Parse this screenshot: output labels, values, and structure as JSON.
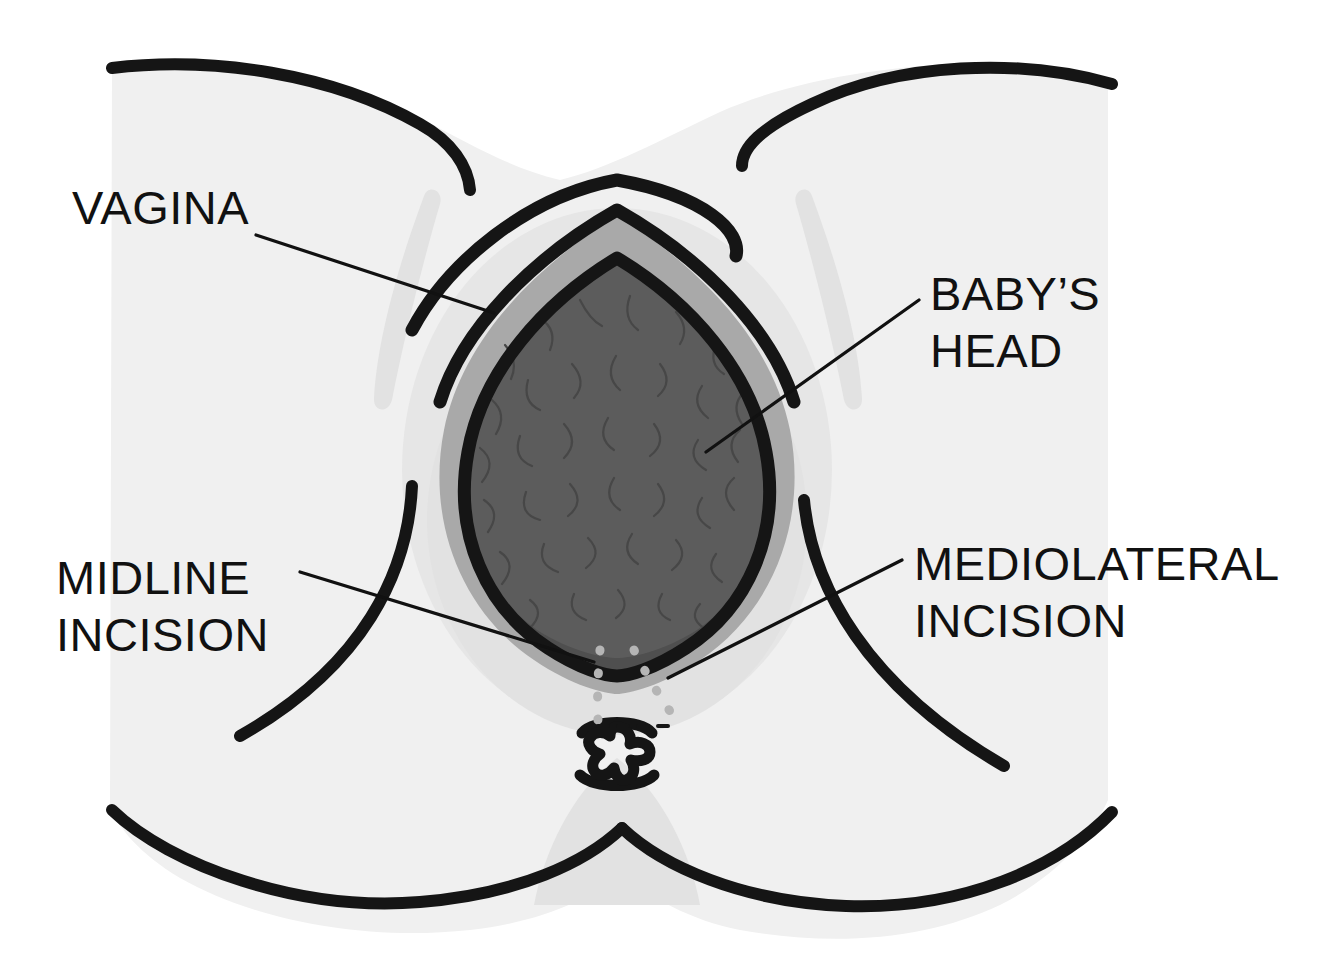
{
  "figure": {
    "title": "Episiotomy incision types during crowning",
    "background_color": "#ffffff",
    "body_fill_color": "#f0f0f0",
    "head_color": "#5c5c5c",
    "labia_color": "#a9a9a9",
    "incision_line_color": "#b5b5b5",
    "ink_color": "#151515"
  },
  "labels": {
    "vagina": {
      "line1": "VAGINA",
      "line2": ""
    },
    "babys_head": {
      "line1": "BABY’S",
      "line2": "HEAD"
    },
    "midline_incision": {
      "line1": "MIDLINE",
      "line2": "INCISION"
    },
    "mediolateral_incision": {
      "line1": "MEDIOLATERAL",
      "line2": "INCISION"
    }
  },
  "parts": {
    "vaginal_ring": "vaginal-ring",
    "baby_head": "baby-head",
    "anus": "anus",
    "midline_incision_line": "midline-incision-line",
    "mediolateral_incision_line": "mediolateral-incision-line",
    "left_thigh": "left-thigh",
    "right_thigh": "right-thigh",
    "perineum": "perineum"
  }
}
